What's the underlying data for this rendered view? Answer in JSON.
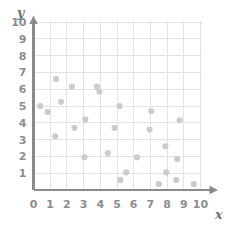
{
  "chart_data": {
    "type": "scatter",
    "title": "",
    "xlabel": "x",
    "ylabel": "y",
    "xlim": [
      0,
      10
    ],
    "ylim": [
      0,
      10
    ],
    "grid": true,
    "legend": "none",
    "xticks": [
      "0",
      "1",
      "2",
      "3",
      "4",
      "5",
      "6",
      "7",
      "8",
      "9",
      "10"
    ],
    "yticks": [
      "1",
      "2",
      "3",
      "4",
      "5",
      "6",
      "7",
      "8",
      "9",
      "10"
    ],
    "xtick_values": [
      0,
      1,
      2,
      3,
      4,
      5,
      6,
      7,
      8,
      9,
      10
    ],
    "ytick_values": [
      1,
      2,
      3,
      4,
      5,
      6,
      7,
      8,
      9,
      10
    ],
    "origin_label": "0",
    "marker": "circle",
    "marker_color": "#cccccf",
    "marker_radius": 3.1,
    "grid_color": "#e3e3e5",
    "axis_color": "#8a8a8e",
    "tick_label_color": "#8d8d91",
    "points": [
      [
        0.4,
        5.0
      ],
      [
        0.85,
        4.65
      ],
      [
        1.3,
        3.2
      ],
      [
        1.35,
        6.6
      ],
      [
        1.65,
        5.25
      ],
      [
        2.3,
        6.15
      ],
      [
        2.45,
        3.7
      ],
      [
        3.05,
        1.95
      ],
      [
        3.1,
        4.2
      ],
      [
        3.8,
        6.15
      ],
      [
        3.95,
        5.85
      ],
      [
        4.45,
        2.2
      ],
      [
        4.85,
        3.7
      ],
      [
        5.15,
        5.0
      ],
      [
        5.2,
        0.6
      ],
      [
        5.55,
        1.05
      ],
      [
        6.2,
        1.95
      ],
      [
        6.95,
        3.6
      ],
      [
        7.05,
        4.7
      ],
      [
        7.5,
        0.35
      ],
      [
        7.9,
        2.6
      ],
      [
        7.95,
        1.05
      ],
      [
        8.55,
        0.6
      ],
      [
        8.6,
        1.85
      ],
      [
        8.75,
        4.15
      ],
      [
        9.6,
        0.35
      ]
    ]
  }
}
